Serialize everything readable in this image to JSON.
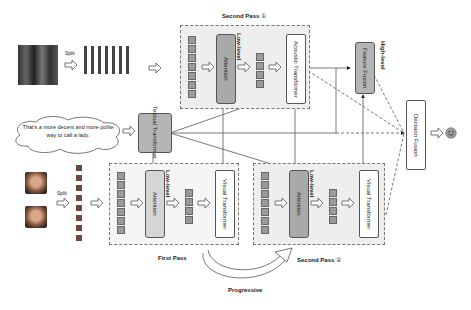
{
  "audio_input": {
    "split_label": "Split"
  },
  "text_input": {
    "utterance": "That's a more decent and more polite way to call a lady."
  },
  "visual_input": {
    "split_label": "Split"
  },
  "textual_transformer": {
    "label": "Textual Transformer"
  },
  "second_pass_1": {
    "title": "Second Pass",
    "index": "①",
    "attention_label": "Attention",
    "level_label": "Low-level",
    "transformer_label": "Acoustic Transformer"
  },
  "first_pass": {
    "title": "First Pass",
    "attention_label": "Attention",
    "level_label": "Low-level",
    "transformer_label": "Visual Transformer"
  },
  "second_pass_2": {
    "title": "Second Pass",
    "index": "②",
    "attention_label": "Attention",
    "level_label": "Low-level",
    "transformer_label": "Visual Transformer"
  },
  "feature_fusion": {
    "label": "Feature Fusion",
    "level_label": "High-level"
  },
  "decision_fusion": {
    "label": "Decision Fusion"
  },
  "output": {
    "icon": "smiley-face"
  },
  "progressive": {
    "label": "Progressive"
  },
  "colors": {
    "box_dark": "#a9a9a9",
    "box_light": "#d5d5d5",
    "pass_bg": "#eeeeee",
    "line": "#555555"
  }
}
